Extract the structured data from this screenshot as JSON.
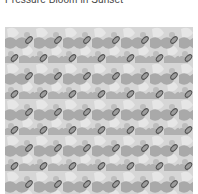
{
  "caption": {
    "title": "Pressure Bloom in Sunset"
  },
  "artwork": {
    "description": "tiled grayscale pattern of tilted dark-outlined ellipses over soft gray blobs",
    "colors": {
      "background": "#d4d4d4",
      "light": "#e2e2e2",
      "blob": "#a8a8a8",
      "ellipse_stroke": "#555555",
      "ellipse_fill": "#9a9a9a"
    },
    "tile": {
      "width": 29,
      "height": 36
    }
  }
}
